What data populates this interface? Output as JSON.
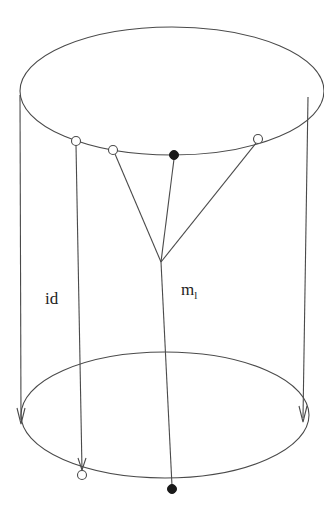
{
  "diagram": {
    "type": "cylinder-cobordism",
    "labels": {
      "id": "id",
      "m_main": "m",
      "m_sub": "l"
    },
    "top_circle": {
      "cx": 172,
      "cy": 91,
      "rx": 152,
      "ry": 64
    },
    "bottom_circle": {
      "cx": 165,
      "cy": 415,
      "rx": 144,
      "ry": 63
    },
    "top_points": [
      {
        "x": 76,
        "y": 141,
        "kind": "hollow"
      },
      {
        "x": 113,
        "y": 150,
        "kind": "hollow"
      },
      {
        "x": 174,
        "y": 155,
        "kind": "filled"
      },
      {
        "x": 258,
        "y": 139,
        "kind": "hollow"
      }
    ],
    "bottom_points": [
      {
        "x": 82,
        "y": 475,
        "kind": "hollow"
      },
      {
        "x": 172,
        "y": 489,
        "kind": "filled"
      }
    ],
    "vertex": {
      "x": 161,
      "y": 262
    },
    "colors": {
      "line": "#4a4a4a",
      "filled_dot": "#1a1a1a",
      "background": "#ffffff"
    }
  }
}
